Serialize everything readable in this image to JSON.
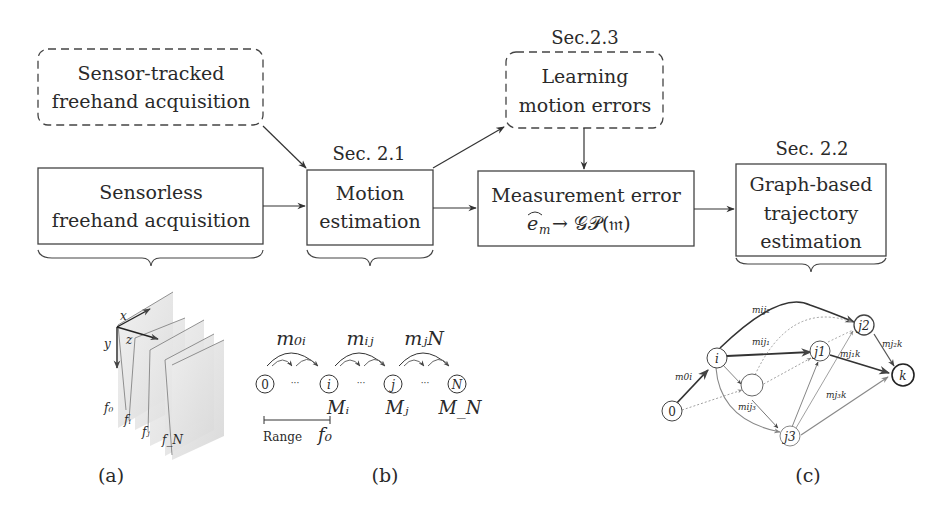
{
  "figure": {
    "boxes": {
      "sensor_tracked": {
        "line1": "Sensor-tracked",
        "line2": "freehand acquisition",
        "style": "dashed"
      },
      "sensorless": {
        "line1": "Sensorless",
        "line2": "freehand acquisition",
        "style": "solid"
      },
      "motion_estimation": {
        "section": "Sec. 2.1",
        "line1": "Motion",
        "line2": "estimation",
        "style": "solid"
      },
      "learning_errors": {
        "section": "Sec.2.3",
        "line1": "Learning",
        "line2": "motion errors",
        "style": "dashed"
      },
      "measurement_error": {
        "line1": "Measurement error",
        "line2_lhs": "e",
        "line2_sub": "m",
        "line2_rhs": "→ 𝒢𝒫(𝔪)",
        "style": "solid"
      },
      "graph_trajectory": {
        "section": "Sec. 2.2",
        "line1": "Graph-based",
        "line2": "trajectory",
        "line3": "estimation",
        "style": "solid"
      }
    },
    "panel_a": {
      "caption": "(a)",
      "axes": {
        "x": "x",
        "y": "y",
        "z": "z"
      },
      "frames": [
        "f₀",
        "fᵢ",
        "fⱼ",
        "f_N"
      ]
    },
    "panel_b": {
      "caption": "(b)",
      "nodes": [
        "0",
        "i",
        "j",
        "N"
      ],
      "ellipsis": "···",
      "transforms": [
        "m₀ᵢ",
        "mᵢⱼ",
        "mⱼN"
      ],
      "node_labels": [
        "Mᵢ",
        "Mⱼ",
        "M_N"
      ],
      "range_label": "Range",
      "range_frame": "f₀"
    },
    "panel_c": {
      "caption": "(c)",
      "nodes": [
        "0",
        "i",
        "j₁",
        "j₂",
        "j₃",
        "k"
      ],
      "edges": [
        "ê_m0i",
        "ê_mij1",
        "ê_mij2",
        "ê_mij3",
        "ê_mj1k",
        "ê_mj2k",
        "ê_mj3k"
      ],
      "edge_labels": {
        "e0i": "e",
        "e0i_sub": "m0i",
        "eij1": "e",
        "eij1_sub": "mij₁",
        "eij2": "e",
        "eij2_sub": "mij₂",
        "eij3": "e",
        "eij3_sub": "mij₃",
        "ej1k": "e",
        "ej1k_sub": "mj₁k",
        "ej2k": "e",
        "ej2k_sub": "mj₂k",
        "ej3k": "e",
        "ej3k_sub": "mj₃k"
      },
      "node_text": {
        "n0": "0",
        "ni": "i",
        "nj1": "j1",
        "nj2": "j2",
        "nj3": "j3",
        "nk": "k"
      }
    }
  }
}
